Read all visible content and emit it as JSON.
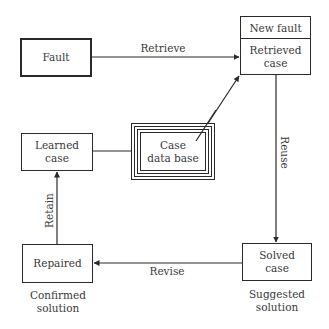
{
  "diagram": {
    "type": "case-based-reasoning-cycle",
    "nodes": {
      "fault": {
        "label": "Fault"
      },
      "new_fault": {
        "header": "New fault",
        "body_line1": "Retrieved",
        "body_line2": "case"
      },
      "case_database": {
        "line1": "Case",
        "line2": "data base"
      },
      "learned_case": {
        "line1": "Learned",
        "line2": "case"
      },
      "repaired": {
        "label": "Repaired",
        "caption_line1": "Confirmed",
        "caption_line2": "solution"
      },
      "solved_case": {
        "line1": "Solved",
        "line2": "case",
        "caption_line1": "Suggested",
        "caption_line2": "solution"
      }
    },
    "edges": {
      "retrieve": {
        "label": "Retrieve",
        "from": "Fault",
        "to": "Retrieved case"
      },
      "database_to_retrieved": {
        "label": "",
        "from": "Case data base",
        "to": "Retrieved case"
      },
      "reuse": {
        "label": "Reuse",
        "from": "Retrieved case",
        "to": "Solved case"
      },
      "revise": {
        "label": "Revise",
        "from": "Solved case",
        "to": "Repaired"
      },
      "retain": {
        "label": "Retain",
        "from": "Repaired",
        "to": "Learned case"
      },
      "learned_to_database": {
        "label": "",
        "from": "Learned case",
        "to": "Case data base"
      }
    },
    "colors": {
      "line": "#2a2a2a",
      "text": "#3a3a3a",
      "background": "#ffffff"
    }
  }
}
